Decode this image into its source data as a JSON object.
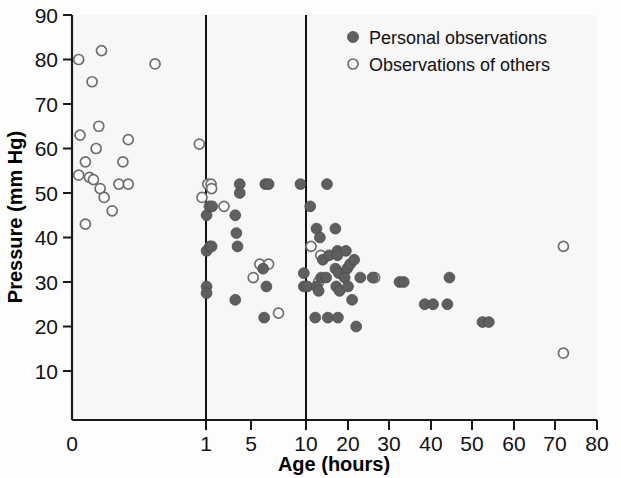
{
  "chart_data": {
    "type": "scatter",
    "title": "",
    "xlabel": "Age (hours)",
    "ylabel": "Pressure (mm Hg)",
    "xlim": [
      0,
      80
    ],
    "ylim": [
      0,
      90
    ],
    "grid": false,
    "x_axis_note": "broken/compressed axis: 0, 1, 5, 10 compressed at left; linear 10-80 to the right",
    "xticks": [
      {
        "label": "0",
        "px": 72
      },
      {
        "label": "1",
        "px": 206
      },
      {
        "label": "5",
        "px": 251
      },
      {
        "label": "10",
        "px": 306
      },
      {
        "label": "20",
        "px": 348
      },
      {
        "label": "30",
        "px": 389
      },
      {
        "label": "40",
        "px": 431
      },
      {
        "label": "50",
        "px": 472
      },
      {
        "label": "60",
        "px": 514
      },
      {
        "label": "70",
        "px": 555
      },
      {
        "label": "80",
        "px": 597
      }
    ],
    "yticks": [
      "10",
      "20",
      "30",
      "40",
      "50",
      "60",
      "70",
      "80",
      "90"
    ],
    "dividers": [
      {
        "label": "1",
        "px": 206
      },
      {
        "label": "10",
        "px": 306
      }
    ],
    "legend": {
      "position": "top-right-inside",
      "entries": [
        {
          "name": "Personal observations",
          "marker": "filled-circle",
          "color": "#5f5f5f"
        },
        {
          "name": "Observations of others",
          "marker": "open-circle",
          "color": "#6e6e6e"
        }
      ]
    },
    "series": [
      {
        "name": "Observations of others",
        "marker": "open-circle",
        "points": [
          {
            "age": 0.05,
            "pressure": 80
          },
          {
            "age": 0.22,
            "pressure": 82
          },
          {
            "age": 0.15,
            "pressure": 75
          },
          {
            "age": 0.62,
            "pressure": 79
          },
          {
            "age": 0.06,
            "pressure": 63
          },
          {
            "age": 0.2,
            "pressure": 65
          },
          {
            "age": 0.18,
            "pressure": 60
          },
          {
            "age": 0.42,
            "pressure": 62
          },
          {
            "age": 0.1,
            "pressure": 57
          },
          {
            "age": 0.38,
            "pressure": 57
          },
          {
            "age": 0.05,
            "pressure": 54
          },
          {
            "age": 0.13,
            "pressure": 53.5
          },
          {
            "age": 0.16,
            "pressure": 53
          },
          {
            "age": 0.21,
            "pressure": 51
          },
          {
            "age": 0.35,
            "pressure": 52
          },
          {
            "age": 0.42,
            "pressure": 52
          },
          {
            "age": 0.24,
            "pressure": 49
          },
          {
            "age": 0.3,
            "pressure": 46
          },
          {
            "age": 0.1,
            "pressure": 43
          },
          {
            "age": 0.95,
            "pressure": 61
          },
          {
            "age": 0.97,
            "pressure": 49
          },
          {
            "age": 1.15,
            "pressure": 52
          },
          {
            "age": 1.45,
            "pressure": 52
          },
          {
            "age": 1.5,
            "pressure": 51
          },
          {
            "age": 2.6,
            "pressure": 47
          },
          {
            "age": 5.8,
            "pressure": 34
          },
          {
            "age": 6.6,
            "pressure": 34
          },
          {
            "age": 5.2,
            "pressure": 31
          },
          {
            "age": 7.5,
            "pressure": 23
          },
          {
            "age": 13.5,
            "pressure": 36
          },
          {
            "age": 13.0,
            "pressure": 30
          },
          {
            "age": 11.2,
            "pressure": 38
          },
          {
            "age": 26.5,
            "pressure": 31
          },
          {
            "age": 72,
            "pressure": 38
          },
          {
            "age": 72,
            "pressure": 14
          }
        ]
      },
      {
        "name": "Personal observations",
        "marker": "filled-circle",
        "points": [
          {
            "age": 1.05,
            "pressure": 45
          },
          {
            "age": 1.05,
            "pressure": 37
          },
          {
            "age": 1.05,
            "pressure": 29
          },
          {
            "age": 1.05,
            "pressure": 27.5
          },
          {
            "age": 1.3,
            "pressure": 47
          },
          {
            "age": 1.55,
            "pressure": 47
          },
          {
            "age": 1.35,
            "pressure": 38
          },
          {
            "age": 1.5,
            "pressure": 38
          },
          {
            "age": 4.0,
            "pressure": 52
          },
          {
            "age": 4.0,
            "pressure": 50
          },
          {
            "age": 3.6,
            "pressure": 45
          },
          {
            "age": 3.7,
            "pressure": 41
          },
          {
            "age": 3.8,
            "pressure": 38
          },
          {
            "age": 3.6,
            "pressure": 26
          },
          {
            "age": 6.3,
            "pressure": 52
          },
          {
            "age": 6.6,
            "pressure": 52
          },
          {
            "age": 6.1,
            "pressure": 33
          },
          {
            "age": 6.4,
            "pressure": 29
          },
          {
            "age": 6.2,
            "pressure": 22
          },
          {
            "age": 9.5,
            "pressure": 52
          },
          {
            "age": 9.8,
            "pressure": 32
          },
          {
            "age": 9.8,
            "pressure": 29
          },
          {
            "age": 10.3,
            "pressure": 29
          },
          {
            "age": 11.0,
            "pressure": 47
          },
          {
            "age": 12.5,
            "pressure": 42
          },
          {
            "age": 13.3,
            "pressure": 40
          },
          {
            "age": 14.0,
            "pressure": 35
          },
          {
            "age": 13.6,
            "pressure": 31
          },
          {
            "age": 12.5,
            "pressure": 29
          },
          {
            "age": 13.0,
            "pressure": 28
          },
          {
            "age": 12.2,
            "pressure": 22
          },
          {
            "age": 15.0,
            "pressure": 52
          },
          {
            "age": 15.5,
            "pressure": 36
          },
          {
            "age": 14.8,
            "pressure": 31
          },
          {
            "age": 15.2,
            "pressure": 22
          },
          {
            "age": 17.0,
            "pressure": 42
          },
          {
            "age": 17.5,
            "pressure": 37
          },
          {
            "age": 17.5,
            "pressure": 36
          },
          {
            "age": 17.0,
            "pressure": 33
          },
          {
            "age": 17.8,
            "pressure": 32
          },
          {
            "age": 17.2,
            "pressure": 29
          },
          {
            "age": 18.0,
            "pressure": 28
          },
          {
            "age": 17.6,
            "pressure": 22
          },
          {
            "age": 19.5,
            "pressure": 37
          },
          {
            "age": 19.8,
            "pressure": 33
          },
          {
            "age": 19.2,
            "pressure": 31
          },
          {
            "age": 20.5,
            "pressure": 34
          },
          {
            "age": 20.0,
            "pressure": 29
          },
          {
            "age": 21.0,
            "pressure": 26
          },
          {
            "age": 21.5,
            "pressure": 35
          },
          {
            "age": 23.0,
            "pressure": 31
          },
          {
            "age": 22.0,
            "pressure": 20
          },
          {
            "age": 26.0,
            "pressure": 31
          },
          {
            "age": 32.5,
            "pressure": 30
          },
          {
            "age": 33.5,
            "pressure": 30
          },
          {
            "age": 38.5,
            "pressure": 25
          },
          {
            "age": 40.5,
            "pressure": 25
          },
          {
            "age": 44.5,
            "pressure": 31
          },
          {
            "age": 44.0,
            "pressure": 25
          },
          {
            "age": 52.5,
            "pressure": 21
          },
          {
            "age": 54.0,
            "pressure": 21
          }
        ]
      }
    ]
  }
}
